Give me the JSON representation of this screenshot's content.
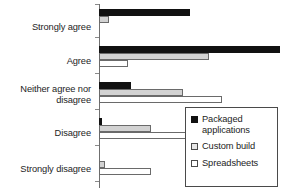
{
  "chart_data": {
    "type": "bar",
    "orientation": "horizontal",
    "title": "",
    "xlabel": "",
    "ylabel": "",
    "grid": false,
    "legend_position": "bottom-right",
    "categories": [
      "Strongly agree",
      "Agree",
      "Neither agree nor disagree",
      "Disagree",
      "Strongly disagree"
    ],
    "xlim": [
      0,
      55
    ],
    "series": [
      {
        "name": "Packaged applications",
        "color": "#111111",
        "values": [
          28,
          56,
          10,
          1,
          0
        ]
      },
      {
        "name": "Custom build",
        "color": "#d2d2d2",
        "values": [
          3,
          34,
          26,
          16,
          2
        ]
      },
      {
        "name": "Spreadsheets",
        "color": "#ffffff",
        "values": [
          0,
          9,
          38,
          27,
          16
        ]
      }
    ]
  },
  "axis": {
    "categories": [
      {
        "label": "Strongly agree"
      },
      {
        "label": "Agree"
      },
      {
        "label": "Neither agree nor"
      },
      {
        "label": "disagree"
      },
      {
        "label": "Disagree"
      },
      {
        "label": "Strongly disagree"
      }
    ]
  },
  "legend": {
    "items": [
      {
        "label_line1": "Packaged",
        "label_line2": "applications",
        "swatch": "black-square-icon"
      },
      {
        "label_line1": "Custom build",
        "label_line2": "",
        "swatch": "gray-square-icon"
      },
      {
        "label_line1": "Spreadsheets",
        "label_line2": "",
        "swatch": "white-square-icon"
      }
    ]
  }
}
